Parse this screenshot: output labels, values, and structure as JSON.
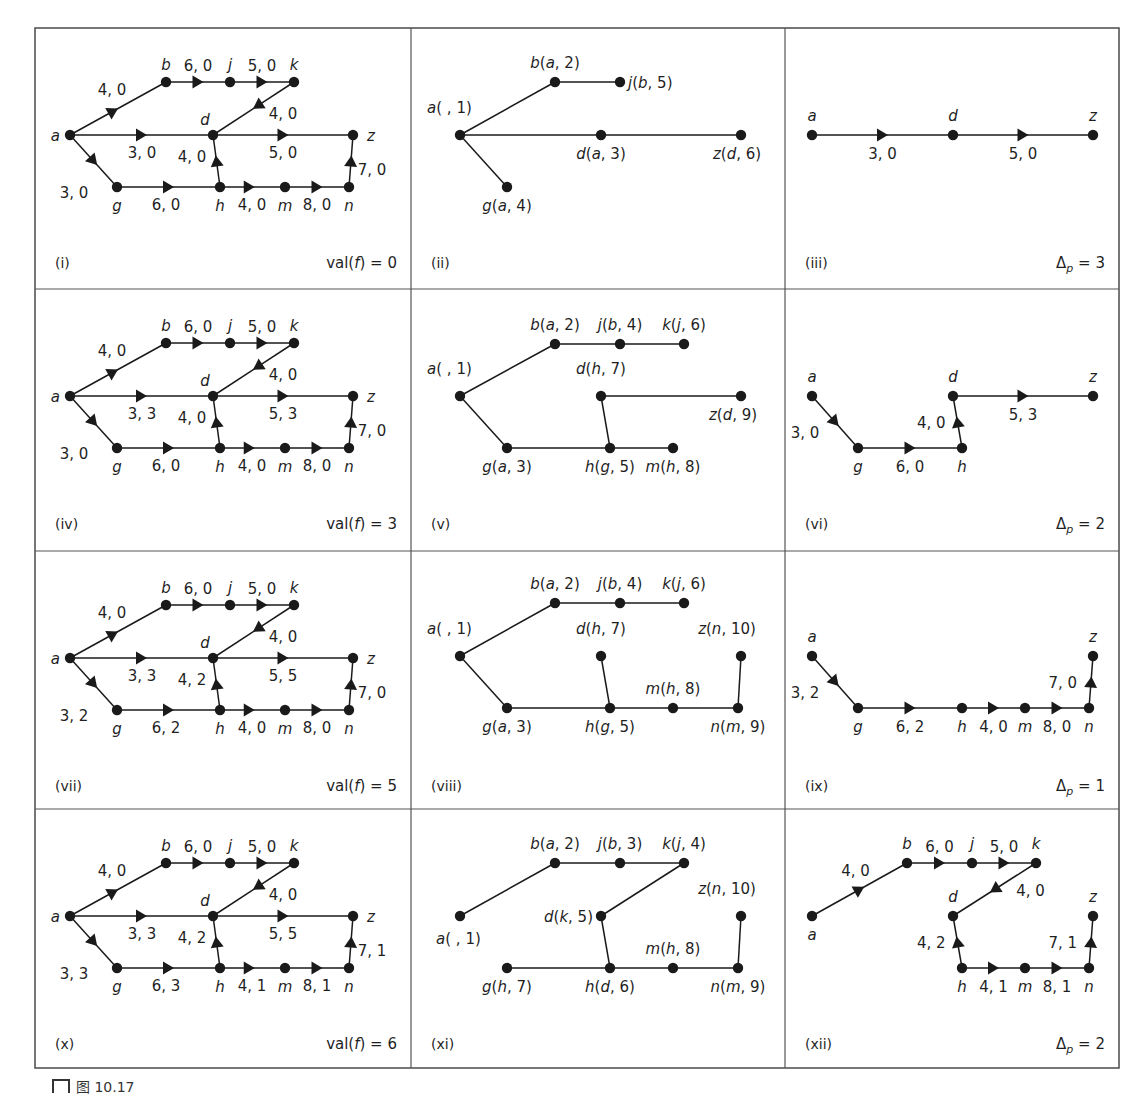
{
  "figure": {
    "caption": "图 10.17",
    "grid": {
      "cols": [
        35,
        411,
        785,
        1119
      ],
      "rows": [
        28,
        289,
        551,
        809,
        1068
      ]
    },
    "colors": {
      "line": "#1a1a1a",
      "border": "#555555",
      "background": "#ffffff"
    }
  },
  "panels": [
    {
      "id": "(i)",
      "type": "network",
      "footer": "val(f) = 0",
      "footer_pre": "val(",
      "footer_var": "f",
      "footer_post": ") = 0",
      "col": 0,
      "row": 0,
      "edges": {
        "ab": "4, 0",
        "bj": "6, 0",
        "jk": "5, 0",
        "kd": "4, 0",
        "ad": "3, 0",
        "dz": "5, 0",
        "ag": "3, 0",
        "gh": "6, 0",
        "hd": "4, 0",
        "hm": "4, 0",
        "mn": "8, 0",
        "nz": "7, 0"
      }
    },
    {
      "id": "(ii)",
      "type": "tree",
      "col": 1,
      "row": 0,
      "nodes": [
        {
          "name": "a",
          "label": "a(  , 1)",
          "x": 460,
          "y": 135
        },
        {
          "name": "b",
          "label": "b(a, 2)",
          "x": 555,
          "y": 82
        },
        {
          "name": "j",
          "label": "j(b, 5)",
          "x": 620,
          "y": 82
        },
        {
          "name": "d",
          "label": "d(a, 3)",
          "x": 601,
          "y": 135
        },
        {
          "name": "z",
          "label": "z(d, 6)",
          "x": 741,
          "y": 135
        },
        {
          "name": "g",
          "label": "g(a, 4)",
          "x": 507,
          "y": 187
        }
      ],
      "tree_edges": [
        [
          "a",
          "b"
        ],
        [
          "b",
          "j"
        ],
        [
          "a",
          "d"
        ],
        [
          "d",
          "z"
        ],
        [
          "a",
          "g"
        ]
      ]
    },
    {
      "id": "(iii)",
      "type": "path",
      "footer": "Δp = 3",
      "delta": "3",
      "col": 2,
      "row": 0,
      "nodes": [
        {
          "name": "a",
          "x": 812,
          "y": 135
        },
        {
          "name": "d",
          "x": 953,
          "y": 135
        },
        {
          "name": "z",
          "x": 1093,
          "y": 135
        }
      ],
      "edges": [
        {
          "from": "a",
          "to": "d",
          "label": "3, 0"
        },
        {
          "from": "d",
          "to": "z",
          "label": "5, 0"
        }
      ]
    },
    {
      "id": "(iv)",
      "type": "network",
      "footer_pre": "val(",
      "footer_var": "f",
      "footer_post": ") = 3",
      "col": 0,
      "row": 1,
      "edges": {
        "ab": "4, 0",
        "bj": "6, 0",
        "jk": "5, 0",
        "kd": "4, 0",
        "ad": "3, 3",
        "dz": "5, 3",
        "ag": "3, 0",
        "gh": "6, 0",
        "hd": "4, 0",
        "hm": "4, 0",
        "mn": "8, 0",
        "nz": "7, 0"
      }
    },
    {
      "id": "(v)",
      "type": "tree",
      "col": 1,
      "row": 1,
      "nodes": [
        {
          "name": "a",
          "label": "a(  , 1)",
          "x": 460,
          "y": 396
        },
        {
          "name": "b",
          "label": "b(a, 2)",
          "x": 555,
          "y": 344
        },
        {
          "name": "j",
          "label": "j(b, 4)",
          "x": 620,
          "y": 344
        },
        {
          "name": "k",
          "label": "k(j, 6)",
          "x": 684,
          "y": 344
        },
        {
          "name": "d",
          "label": "d(h, 7)",
          "x": 601,
          "y": 396
        },
        {
          "name": "z",
          "label": "z(d, 9)",
          "x": 741,
          "y": 396
        },
        {
          "name": "g",
          "label": "g(a, 3)",
          "x": 507,
          "y": 448
        },
        {
          "name": "h",
          "label": "h(g, 5)",
          "x": 610,
          "y": 448
        },
        {
          "name": "m",
          "label": "m(h, 8)",
          "x": 673,
          "y": 448
        }
      ],
      "tree_edges": [
        [
          "a",
          "b"
        ],
        [
          "b",
          "j"
        ],
        [
          "j",
          "k"
        ],
        [
          "a",
          "g"
        ],
        [
          "g",
          "h"
        ],
        [
          "h",
          "m"
        ],
        [
          "h",
          "d"
        ],
        [
          "d",
          "z"
        ]
      ]
    },
    {
      "id": "(vi)",
      "type": "path",
      "delta": "2",
      "col": 2,
      "row": 1,
      "nodes": [
        {
          "name": "a",
          "x": 812,
          "y": 396
        },
        {
          "name": "g",
          "x": 858,
          "y": 448
        },
        {
          "name": "h",
          "x": 962,
          "y": 448
        },
        {
          "name": "d",
          "x": 953,
          "y": 396
        },
        {
          "name": "z",
          "x": 1093,
          "y": 396
        }
      ],
      "edges": [
        {
          "from": "a",
          "to": "g",
          "label": "3, 0"
        },
        {
          "from": "g",
          "to": "h",
          "label": "6, 0"
        },
        {
          "from": "h",
          "to": "d",
          "label": "4, 0"
        },
        {
          "from": "d",
          "to": "z",
          "label": "5, 3"
        }
      ]
    },
    {
      "id": "(vii)",
      "type": "network",
      "footer_pre": "val(",
      "footer_var": "f",
      "footer_post": ") = 5",
      "col": 0,
      "row": 2,
      "edges": {
        "ab": "4, 0",
        "bj": "6, 0",
        "jk": "5, 0",
        "kd": "4, 0",
        "ad": "3, 3",
        "dz": "5, 5",
        "ag": "3, 2",
        "gh": "6, 2",
        "hd": "4, 2",
        "hm": "4, 0",
        "mn": "8, 0",
        "nz": "7, 0"
      }
    },
    {
      "id": "(viii)",
      "type": "tree",
      "col": 1,
      "row": 2,
      "nodes": [
        {
          "name": "a",
          "label": "a(  , 1)",
          "x": 460,
          "y": 656
        },
        {
          "name": "b",
          "label": "b(a, 2)",
          "x": 555,
          "y": 603
        },
        {
          "name": "j",
          "label": "j(b, 4)",
          "x": 620,
          "y": 603
        },
        {
          "name": "k",
          "label": "k(j, 6)",
          "x": 684,
          "y": 603
        },
        {
          "name": "d",
          "label": "d(h, 7)",
          "x": 601,
          "y": 656
        },
        {
          "name": "z",
          "label": "z(n, 10)",
          "x": 741,
          "y": 656
        },
        {
          "name": "g",
          "label": "g(a, 3)",
          "x": 507,
          "y": 708
        },
        {
          "name": "h",
          "label": "h(g, 5)",
          "x": 610,
          "y": 708
        },
        {
          "name": "m",
          "label": "m(h, 8)",
          "x": 673,
          "y": 708
        },
        {
          "name": "n",
          "label": "n(m, 9)",
          "x": 738,
          "y": 708
        }
      ],
      "tree_edges": [
        [
          "a",
          "b"
        ],
        [
          "b",
          "j"
        ],
        [
          "j",
          "k"
        ],
        [
          "a",
          "g"
        ],
        [
          "g",
          "h"
        ],
        [
          "h",
          "d"
        ],
        [
          "h",
          "m"
        ],
        [
          "m",
          "n"
        ],
        [
          "n",
          "z"
        ]
      ]
    },
    {
      "id": "(ix)",
      "type": "path",
      "delta": "1",
      "col": 2,
      "row": 2,
      "nodes": [
        {
          "name": "a",
          "x": 812,
          "y": 656
        },
        {
          "name": "g",
          "x": 858,
          "y": 708
        },
        {
          "name": "h",
          "x": 962,
          "y": 708
        },
        {
          "name": "m",
          "x": 1025,
          "y": 708
        },
        {
          "name": "n",
          "x": 1089,
          "y": 708
        },
        {
          "name": "z",
          "x": 1093,
          "y": 656
        }
      ],
      "edges": [
        {
          "from": "a",
          "to": "g",
          "label": "3, 2"
        },
        {
          "from": "g",
          "to": "h",
          "label": "6, 2"
        },
        {
          "from": "h",
          "to": "m",
          "label": "4, 0"
        },
        {
          "from": "m",
          "to": "n",
          "label": "8, 0"
        },
        {
          "from": "n",
          "to": "z",
          "label": "7, 0"
        }
      ]
    },
    {
      "id": "(x)",
      "type": "network",
      "footer_pre": "val(",
      "footer_var": "f",
      "footer_post": ") = 6",
      "col": 0,
      "row": 3,
      "edges": {
        "ab": "4, 0",
        "bj": "6, 0",
        "jk": "5, 0",
        "kd": "4, 0",
        "ad": "3, 3",
        "dz": "5, 5",
        "ag": "3, 3",
        "gh": "6, 3",
        "hd": "4, 2",
        "hm": "4, 1",
        "mn": "8, 1",
        "nz": "7, 1"
      }
    },
    {
      "id": "(xi)",
      "type": "tree",
      "col": 1,
      "row": 3,
      "nodes": [
        {
          "name": "a",
          "label": "a(  , 1)",
          "x": 460,
          "y": 916
        },
        {
          "name": "b",
          "label": "b(a, 2)",
          "x": 555,
          "y": 863
        },
        {
          "name": "j",
          "label": "j(b, 3)",
          "x": 620,
          "y": 863
        },
        {
          "name": "k",
          "label": "k(j, 4)",
          "x": 684,
          "y": 863
        },
        {
          "name": "d",
          "label": "d(k, 5)",
          "x": 601,
          "y": 916
        },
        {
          "name": "z",
          "label": "z(n, 10)",
          "x": 741,
          "y": 916
        },
        {
          "name": "g",
          "label": "g(h, 7)",
          "x": 507,
          "y": 968
        },
        {
          "name": "h",
          "label": "h(d, 6)",
          "x": 610,
          "y": 968
        },
        {
          "name": "m",
          "label": "m(h, 8)",
          "x": 673,
          "y": 968
        },
        {
          "name": "n",
          "label": "n(m, 9)",
          "x": 738,
          "y": 968
        }
      ],
      "tree_edges": [
        [
          "a",
          "b"
        ],
        [
          "b",
          "j"
        ],
        [
          "j",
          "k"
        ],
        [
          "k",
          "d"
        ],
        [
          "d",
          "h"
        ],
        [
          "h",
          "g"
        ],
        [
          "h",
          "m"
        ],
        [
          "m",
          "n"
        ],
        [
          "n",
          "z"
        ]
      ]
    },
    {
      "id": "(xii)",
      "type": "path",
      "delta": "2",
      "col": 2,
      "row": 3,
      "nodes": [
        {
          "name": "a",
          "x": 812,
          "y": 916
        },
        {
          "name": "b",
          "x": 907,
          "y": 863
        },
        {
          "name": "j",
          "x": 972,
          "y": 863
        },
        {
          "name": "k",
          "x": 1036,
          "y": 863
        },
        {
          "name": "d",
          "x": 953,
          "y": 916
        },
        {
          "name": "h",
          "x": 962,
          "y": 968
        },
        {
          "name": "m",
          "x": 1025,
          "y": 968
        },
        {
          "name": "n",
          "x": 1089,
          "y": 968
        },
        {
          "name": "z",
          "x": 1093,
          "y": 916
        }
      ],
      "edges": [
        {
          "from": "a",
          "to": "b",
          "label": "4, 0"
        },
        {
          "from": "b",
          "to": "j",
          "label": "6, 0"
        },
        {
          "from": "j",
          "to": "k",
          "label": "5, 0"
        },
        {
          "from": "k",
          "to": "d",
          "label": "4, 0"
        },
        {
          "from": "h",
          "to": "d",
          "label": "4, 2"
        },
        {
          "from": "h",
          "to": "m",
          "label": "4, 1"
        },
        {
          "from": "m",
          "to": "n",
          "label": "8, 1"
        },
        {
          "from": "n",
          "to": "z",
          "label": "7, 1"
        }
      ]
    }
  ]
}
